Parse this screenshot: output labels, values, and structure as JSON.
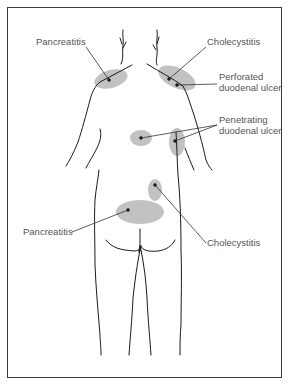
{
  "figure": {
    "colors": {
      "outline": "#1a1a1a",
      "pain_area": "#bdbdbd",
      "leader": "#333333",
      "label_text": "#555555",
      "frame": "#3a3a3a"
    },
    "labels": {
      "pancreatitis_shoulder": "Pancreatitis",
      "cholecystitis_shoulder": "Cholecystitis",
      "perforated_line1": "Perforated",
      "perforated_line2": "duodenal ulcer",
      "penetrating_line1": "Penetrating",
      "penetrating_line2": "duodenal ulcer",
      "cholecystitis_back": "Cholecystitis",
      "pancreatitis_back": "Pancreatitis"
    }
  }
}
